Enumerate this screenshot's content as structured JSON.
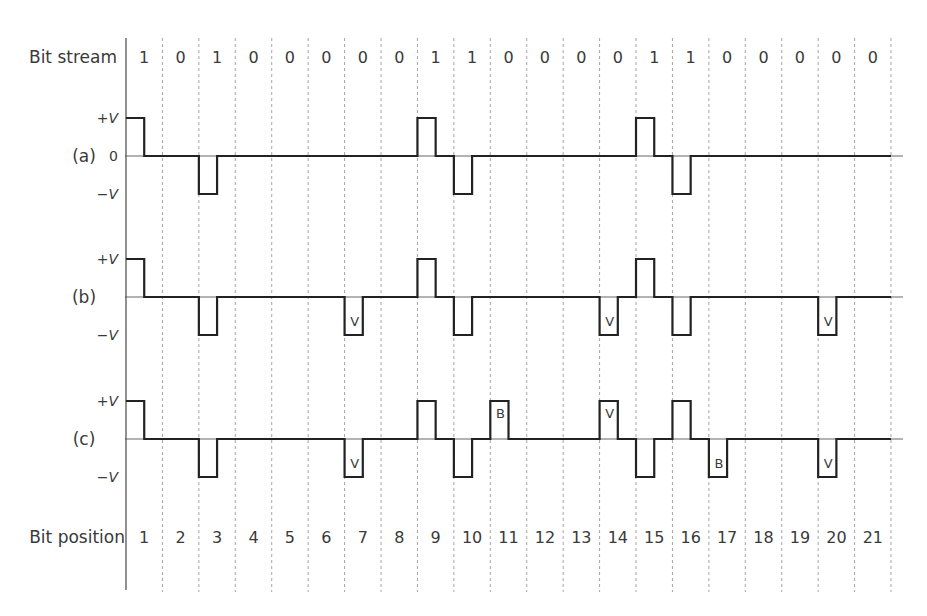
{
  "figure": {
    "header_label": "Bit stream",
    "footer_label": "Bit position",
    "level_labels": {
      "plus": "+V",
      "zero": "0",
      "minus": "−V"
    },
    "colors": {
      "waveform": "#222222",
      "axis": "#555555",
      "grid": "#9a9a9a",
      "text": "#3a3a3a",
      "background": "#ffffff"
    }
  },
  "chart_data": {
    "type": "line",
    "subtype": "digital-waveform",
    "title": "",
    "xlabel": "Bit position",
    "ylabel": "",
    "bit_stream": [
      1,
      0,
      1,
      0,
      0,
      0,
      0,
      0,
      1,
      1,
      0,
      0,
      0,
      0,
      1,
      1,
      0,
      0,
      0,
      0,
      0
    ],
    "bit_positions": [
      1,
      2,
      3,
      4,
      5,
      6,
      7,
      8,
      9,
      10,
      11,
      12,
      13,
      14,
      15,
      16,
      17,
      18,
      19,
      20,
      21
    ],
    "y_levels": [
      "+V",
      "0",
      "-V"
    ],
    "grid": "vertical dashed lines at bit boundaries",
    "pulse_width": "half bit period (return-to-zero)",
    "series": [
      {
        "name": "(a)",
        "description": "AMI (bipolar)",
        "show_zero_label": true,
        "levels": [
          1,
          0,
          -1,
          0,
          0,
          0,
          0,
          0,
          1,
          -1,
          0,
          0,
          0,
          0,
          1,
          -1,
          0,
          0,
          0,
          0,
          0
        ],
        "marks": [
          null,
          null,
          null,
          null,
          null,
          null,
          null,
          null,
          null,
          null,
          null,
          null,
          null,
          null,
          null,
          null,
          null,
          null,
          null,
          null,
          null
        ]
      },
      {
        "name": "(b)",
        "description": "AMI with violation pulses",
        "show_zero_label": false,
        "levels": [
          1,
          0,
          -1,
          0,
          0,
          0,
          -1,
          0,
          1,
          -1,
          0,
          0,
          0,
          -1,
          1,
          -1,
          0,
          0,
          0,
          -1,
          0
        ],
        "marks": [
          null,
          null,
          null,
          null,
          null,
          null,
          "V",
          null,
          null,
          null,
          null,
          null,
          null,
          "V",
          null,
          null,
          null,
          null,
          null,
          "V",
          null
        ]
      },
      {
        "name": "(c)",
        "description": "AMI with bipolar (B) and violation (V) substitution",
        "show_zero_label": false,
        "levels": [
          1,
          0,
          -1,
          0,
          0,
          0,
          -1,
          0,
          1,
          -1,
          1,
          0,
          0,
          1,
          -1,
          1,
          -1,
          0,
          0,
          -1,
          0
        ],
        "marks": [
          null,
          null,
          null,
          null,
          null,
          null,
          "V",
          null,
          null,
          null,
          "B",
          null,
          null,
          "V",
          null,
          null,
          "B",
          null,
          null,
          "V",
          null
        ]
      }
    ]
  }
}
